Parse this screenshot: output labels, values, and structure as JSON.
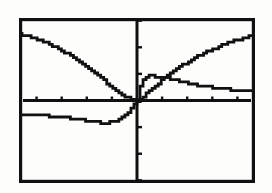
{
  "device": {
    "name": "graphing-calculator-screen",
    "background_color": "#fdfdfc",
    "ink_color": "#111111"
  },
  "chart_data": {
    "type": "line",
    "title": "",
    "subtitle": "",
    "xlabel": "",
    "ylabel": "",
    "xlim": [
      -4.7,
      4.7
    ],
    "ylim": [
      -3.1,
      3.1
    ],
    "grid": false,
    "legend": "none",
    "axis_style": "centered-cross-with-ticks",
    "x_tick_step": 1,
    "y_tick_step": 1,
    "x_ticks": [
      -4,
      -3,
      -2,
      -1,
      1,
      2,
      3,
      4
    ],
    "y_ticks": [
      -3,
      -2,
      -1,
      1,
      2,
      3
    ],
    "tick_labels_visible": false,
    "border": true,
    "series": [
      {
        "name": "descending-curve",
        "style": "solid",
        "description": "starts high at left edge, falls steadily, crosses x-axis just left of origin",
        "x": [
          -4.7,
          -4.4,
          -4.1,
          -3.8,
          -3.5,
          -3.2,
          -2.9,
          -2.6,
          -2.3,
          -2.0,
          -1.7,
          -1.4,
          -1.1,
          -0.8,
          -0.5,
          -0.3,
          -0.15,
          0
        ],
        "y": [
          2.48,
          2.42,
          2.34,
          2.24,
          2.12,
          1.98,
          1.82,
          1.64,
          1.44,
          1.24,
          1.02,
          0.8,
          0.58,
          0.36,
          0.16,
          0.06,
          0.02,
          0
        ]
      },
      {
        "name": "rising-curve",
        "style": "solid",
        "description": "rises from origin, concave down, approaches upper right",
        "x": [
          0,
          0.2,
          0.4,
          0.7,
          1.0,
          1.3,
          1.6,
          1.9,
          2.2,
          2.5,
          2.8,
          3.1,
          3.4,
          3.7,
          4.0,
          4.3,
          4.7
        ],
        "y": [
          0,
          0.12,
          0.28,
          0.52,
          0.78,
          1.0,
          1.2,
          1.38,
          1.55,
          1.7,
          1.84,
          1.96,
          2.08,
          2.18,
          2.28,
          2.36,
          2.46
        ]
      },
      {
        "name": "decaying-plateau-curve",
        "style": "solid",
        "description": "jumps up sharply from origin then decays and flattens toward the right edge",
        "x": [
          0,
          0.1,
          0.2,
          0.35,
          0.5,
          0.8,
          1.1,
          1.4,
          1.7,
          2.0,
          2.4,
          2.8,
          3.2,
          3.6,
          4.0,
          4.4,
          4.7
        ],
        "y": [
          0,
          0.5,
          0.78,
          0.9,
          0.92,
          0.9,
          0.86,
          0.8,
          0.72,
          0.66,
          0.58,
          0.52,
          0.46,
          0.42,
          0.4,
          0.38,
          0.38
        ]
      },
      {
        "name": "lower-flat-curve",
        "style": "solid",
        "description": "nearly flat below the x-axis on the left, dips slightly then rises sharply to meet the origin",
        "x": [
          -4.7,
          -4.3,
          -3.9,
          -3.5,
          -3.1,
          -2.7,
          -2.3,
          -1.9,
          -1.6,
          -1.3,
          -1.0,
          -0.7,
          -0.45,
          -0.25,
          -0.1,
          0
        ],
        "y": [
          -0.52,
          -0.53,
          -0.55,
          -0.58,
          -0.62,
          -0.67,
          -0.72,
          -0.78,
          -0.82,
          -0.84,
          -0.82,
          -0.72,
          -0.52,
          -0.3,
          -0.12,
          0
        ]
      }
    ]
  }
}
